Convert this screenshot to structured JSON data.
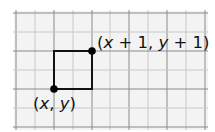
{
  "diagram": {
    "grid": {
      "x_lines": [
        16,
        35,
        54,
        73,
        92,
        110,
        129,
        148,
        167,
        186,
        205
      ],
      "y_lines": [
        13,
        32,
        51,
        70,
        89,
        108,
        127
      ],
      "major_every": 2,
      "background": "#f3f3f3",
      "major_color": "#8a8a8a",
      "minor_color": "#c8c8c8"
    },
    "square": {
      "x1": 54,
      "y1": 51,
      "x2": 92,
      "y2": 89,
      "color": "#111111"
    },
    "points": [
      {
        "name": "lower-left",
        "cx": 54,
        "cy": 89,
        "label_parts": [
          "(",
          "x",
          ", ",
          "y",
          ")"
        ]
      },
      {
        "name": "upper-right",
        "cx": 92,
        "cy": 51,
        "label_parts": [
          "(",
          "x",
          " + 1, ",
          "y",
          " + 1)"
        ]
      }
    ],
    "labels": {
      "lower_left": {
        "open": "(",
        "var1": "x",
        "sep": ", ",
        "var2": "y",
        "close": ")"
      },
      "upper_right": {
        "open": "(",
        "var1": "x",
        "mid": " + 1, ",
        "var2": "y",
        "close": " + 1)"
      }
    }
  }
}
